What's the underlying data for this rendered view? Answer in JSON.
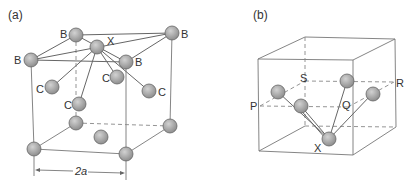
{
  "panels": [
    {
      "id": "a",
      "label": "(a)",
      "atom_labels": {
        "X": "X",
        "B1": "B",
        "B2": "B",
        "B3": "B",
        "B4": "B",
        "C1": "C",
        "C2": "C",
        "C3": "C",
        "C4": "C"
      },
      "dimension_label": "2a"
    },
    {
      "id": "b",
      "label": "(b)",
      "point_labels": {
        "P": "P",
        "Q": "Q",
        "R": "R",
        "S": "S",
        "X": "X"
      }
    }
  ],
  "colors": {
    "atom_fill": "#a8a8a8",
    "line": "#777777",
    "text": "#333333"
  }
}
